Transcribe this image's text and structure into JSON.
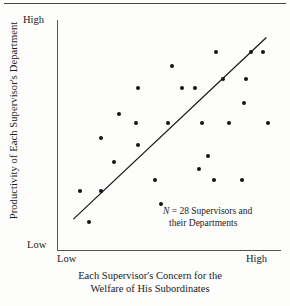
{
  "figure": {
    "top_rule": "",
    "y_axis_title": "Productivity of Each Supervisor's Department",
    "x_axis_title_line1": "Each Supervisor's Concern for the",
    "x_axis_title_line2": "Welfare of His Subordinates",
    "y_high_label": "High",
    "y_low_label": "Low",
    "x_low_label": "Low",
    "x_high_label": "High",
    "annotation_line1_n": "N",
    "annotation_line1_rest": " = 28 Supervisors and",
    "annotation_line2": "their Departments",
    "ink_color": "#141414",
    "axis_color": "#555555"
  },
  "chart_data": {
    "type": "scatter",
    "title": "",
    "xlabel": "Each Supervisor's Concern for the Welfare of His Subordinates",
    "ylabel": "Productivity of Each Supervisor's Department",
    "xlim": [
      0,
      100
    ],
    "ylim": [
      0,
      100
    ],
    "xtick_labels": [
      "Low",
      "High"
    ],
    "ytick_labels": [
      "Low",
      "High"
    ],
    "grid": false,
    "legend": null,
    "n": 28,
    "annotation": "N = 28 Supervisors and their Departments",
    "points": [
      {
        "x": 9,
        "y": 25
      },
      {
        "x": 13,
        "y": 11
      },
      {
        "x": 19,
        "y": 25
      },
      {
        "x": 19,
        "y": 49
      },
      {
        "x": 25,
        "y": 38
      },
      {
        "x": 27,
        "y": 60
      },
      {
        "x": 35,
        "y": 56
      },
      {
        "x": 36,
        "y": 46
      },
      {
        "x": 36,
        "y": 72
      },
      {
        "x": 44,
        "y": 30
      },
      {
        "x": 47,
        "y": 19
      },
      {
        "x": 50,
        "y": 56
      },
      {
        "x": 52,
        "y": 82
      },
      {
        "x": 57,
        "y": 72
      },
      {
        "x": 63,
        "y": 72
      },
      {
        "x": 65,
        "y": 35
      },
      {
        "x": 66,
        "y": 56
      },
      {
        "x": 69,
        "y": 41
      },
      {
        "x": 72,
        "y": 30
      },
      {
        "x": 73,
        "y": 88
      },
      {
        "x": 76,
        "y": 76
      },
      {
        "x": 79,
        "y": 56
      },
      {
        "x": 85,
        "y": 30
      },
      {
        "x": 86,
        "y": 65
      },
      {
        "x": 87,
        "y": 76
      },
      {
        "x": 89,
        "y": 88
      },
      {
        "x": 95,
        "y": 88
      },
      {
        "x": 97,
        "y": 56
      }
    ],
    "trend_line": {
      "x0": 5.8,
      "y0": 12.2,
      "x1": 96.4,
      "y1": 94.8
    }
  }
}
